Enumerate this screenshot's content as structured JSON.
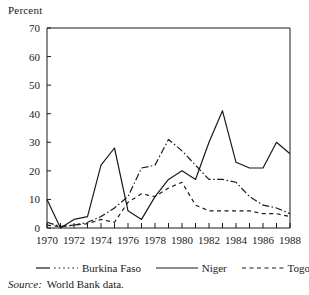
{
  "axis": {
    "y_title": "Percent",
    "y_ticks": [
      0,
      10,
      20,
      30,
      40,
      50,
      60,
      70
    ],
    "x_ticks_labeled": [
      1970,
      1972,
      1974,
      1976,
      1978,
      1980,
      1982,
      1984,
      1986,
      1988
    ]
  },
  "legend": {
    "items": [
      {
        "label": "Burkina Faso",
        "style": "dash-dot",
        "swatch": "line-dashdot-icon"
      },
      {
        "label": "Niger",
        "style": "solid",
        "swatch": "line-solid-icon"
      },
      {
        "label": "Togo",
        "style": "dashed",
        "swatch": "line-dashed-icon"
      }
    ]
  },
  "source": {
    "keyword": "Source:",
    "text": "World Bank data."
  },
  "chart_data": {
    "type": "line",
    "title": "",
    "xlabel": "",
    "ylabel": "Percent",
    "xlim": [
      1970,
      1988
    ],
    "ylim": [
      0,
      70
    ],
    "ytick_step": 10,
    "xtick_step": 1,
    "xtick_label_step": 2,
    "grid": false,
    "legend_position": "below",
    "x": [
      1970,
      1971,
      1972,
      1973,
      1974,
      1975,
      1976,
      1977,
      1978,
      1979,
      1980,
      1981,
      1982,
      1983,
      1984,
      1985,
      1986,
      1987,
      1988
    ],
    "series": [
      {
        "name": "Burkina Faso",
        "style": "dash-dot",
        "color": "#1a1a1a",
        "values": [
          2,
          0.5,
          1,
          2,
          4,
          7,
          11,
          21,
          22,
          31,
          27,
          22,
          17,
          17,
          16,
          11,
          8,
          7,
          5
        ]
      },
      {
        "name": "Niger",
        "style": "solid",
        "color": "#1a1a1a",
        "values": [
          10,
          0,
          3,
          4,
          22,
          28,
          6,
          3,
          11,
          17,
          20,
          17,
          30,
          41,
          23,
          21,
          21,
          30,
          26
        ]
      },
      {
        "name": "Togo",
        "style": "dashed",
        "color": "#1a1a1a",
        "values": [
          1,
          0.5,
          1,
          1.5,
          3,
          2,
          9,
          12,
          11,
          14,
          16,
          8,
          6,
          6,
          6,
          6,
          5,
          5,
          4
        ]
      }
    ]
  }
}
